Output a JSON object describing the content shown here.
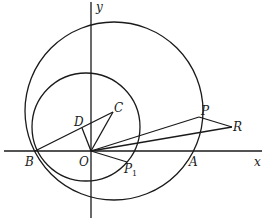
{
  "diagram": {
    "type": "geometry",
    "axes": {
      "x_label": "x",
      "y_label": "y",
      "origin_label": "O"
    },
    "points": {
      "O": {
        "label": "O",
        "x": 91,
        "y": 151
      },
      "B": {
        "label": "B",
        "x": 35,
        "y": 151
      },
      "A": {
        "label": "A",
        "x": 191,
        "y": 151
      },
      "C": {
        "label": "C",
        "x": 113,
        "y": 112
      },
      "D": {
        "label": "D",
        "x": 82,
        "y": 128
      },
      "P": {
        "label": "P",
        "x": 199,
        "y": 117
      },
      "R": {
        "label": "R",
        "x": 232,
        "y": 127
      },
      "P1": {
        "label": "P",
        "subscript": "1",
        "x": 127,
        "y": 162
      }
    },
    "circles": [
      {
        "name": "large-circle",
        "cx": 114,
        "cy": 111,
        "r": 89
      },
      {
        "name": "small-circle",
        "cx": 86,
        "cy": 127,
        "r": 54
      }
    ],
    "segments": [
      [
        "B",
        "C"
      ],
      [
        "O",
        "C"
      ],
      [
        "O",
        "D"
      ],
      [
        "O",
        "P"
      ],
      [
        "P",
        "R"
      ],
      [
        "O",
        "R"
      ],
      [
        "O",
        "P1"
      ]
    ]
  }
}
